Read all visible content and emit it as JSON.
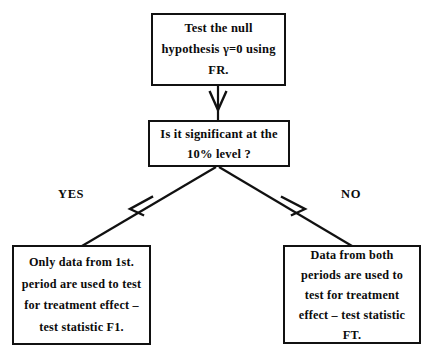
{
  "diagram": {
    "background_color": "#ffffff",
    "stroke_color": "#111111",
    "text_color": "#0b0b0b",
    "nodes": {
      "null_hypothesis": {
        "lines": [
          "Test the null",
          "hypothesis γ=0 using",
          "FR."
        ]
      },
      "significance_question": {
        "lines": [
          "Is it significant at the",
          "10% level ?"
        ]
      },
      "first_period_result": {
        "lines": [
          "Only data from 1st.",
          "period are used to test",
          "for treatment effect –",
          "test statistic F1."
        ]
      },
      "both_periods_result": {
        "lines": [
          "Data from both",
          "periods are used to",
          "test for treatment",
          "effect – test statistic",
          "FT."
        ]
      }
    },
    "branches": {
      "yes_label": "YES",
      "no_label": "NO"
    },
    "connectors": [
      {
        "name": "arrow-null-to-question",
        "from": "null_hypothesis",
        "to": "significance_question",
        "kind": "vertical-arrow"
      },
      {
        "name": "arrow-question-to-first-period",
        "from": "significance_question",
        "to": "first_period_result",
        "kind": "diagonal-arrow",
        "branch": "YES"
      },
      {
        "name": "arrow-question-to-both-periods",
        "from": "significance_question",
        "to": "both_periods_result",
        "kind": "diagonal-arrow",
        "branch": "NO"
      }
    ]
  }
}
